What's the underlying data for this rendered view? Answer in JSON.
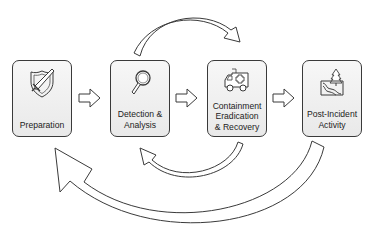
{
  "diagram": {
    "type": "incident-response-lifecycle",
    "stages": [
      {
        "id": "preparation",
        "label": "Preparation",
        "icon": "shield-sword-icon"
      },
      {
        "id": "detection",
        "label": "Detection &\nAnalysis",
        "icon": "magnifier-icon"
      },
      {
        "id": "containment",
        "label": "Containment\nEradication\n& Recovery",
        "icon": "ambulance-icon"
      },
      {
        "id": "post-incident",
        "label": "Post-Incident\nActivity",
        "icon": "landscape-tree-icon"
      }
    ],
    "connectors": [
      {
        "from": "preparation",
        "to": "detection",
        "style": "straight-block-arrow"
      },
      {
        "from": "detection",
        "to": "containment",
        "style": "straight-block-arrow"
      },
      {
        "from": "containment",
        "to": "post-incident",
        "style": "straight-block-arrow"
      },
      {
        "from": "detection",
        "to": "containment",
        "style": "curved-arrow-top"
      },
      {
        "from": "containment",
        "to": "detection",
        "style": "curved-arrow-bottom-small"
      },
      {
        "from": "post-incident",
        "to": "preparation",
        "style": "curved-arrow-bottom-large"
      }
    ],
    "colors": {
      "stroke": "#3a3a3a",
      "box_fill_top": "#f7f7f7",
      "box_fill_bottom": "#e9e9e9",
      "text": "#222222"
    }
  }
}
